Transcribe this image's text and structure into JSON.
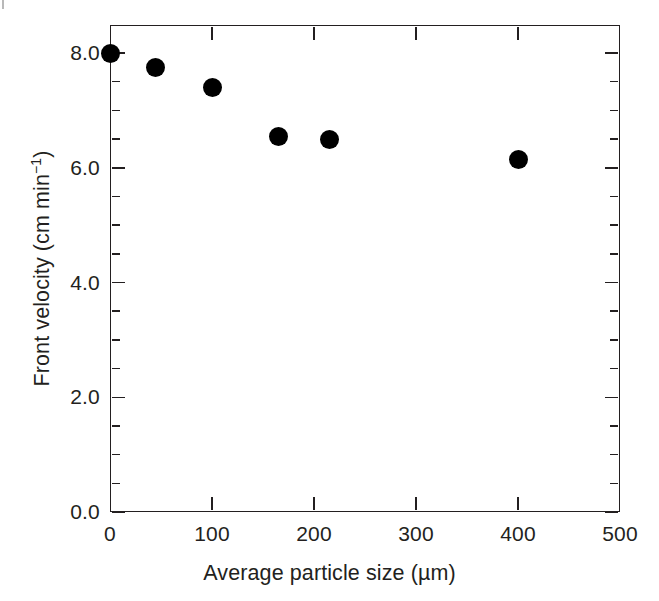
{
  "chart_data": {
    "type": "scatter",
    "title": "",
    "xlabel": "Average particle size (µm)",
    "ylabel_main": "Front velocity (cm min",
    "ylabel_sup": "−1",
    "ylabel_tail": ")",
    "ylabel_full": "Front velocity (cm min⁻¹)",
    "xlim": [
      0,
      500
    ],
    "ylim": [
      0,
      8.6
    ],
    "grid": false,
    "legend": null,
    "marker_style": "filled-circle",
    "marker_color": "#000000",
    "axis_color": "#231f20",
    "background_color": "#ffffff",
    "x": [
      0,
      45,
      100,
      165,
      215,
      400
    ],
    "y": [
      8.0,
      7.75,
      7.4,
      6.55,
      6.5,
      6.15
    ],
    "points": [
      {
        "x": 0,
        "y": 8.0
      },
      {
        "x": 45,
        "y": 7.75
      },
      {
        "x": 100,
        "y": 7.4
      },
      {
        "x": 165,
        "y": 6.55
      },
      {
        "x": 215,
        "y": 6.5
      },
      {
        "x": 400,
        "y": 6.15
      }
    ],
    "xticks": [
      0,
      100,
      200,
      300,
      400,
      500
    ],
    "xticklabels": [
      "0",
      "100",
      "200",
      "300",
      "400",
      "500"
    ],
    "yticks": [
      0.0,
      2.0,
      4.0,
      6.0,
      8.0
    ],
    "yticklabels": [
      "0.0",
      "2.0",
      "4.0",
      "6.0",
      "8.0"
    ],
    "y_minor_step": 0.5,
    "tick_direction": "in",
    "frame": "box-all-four-sides"
  }
}
